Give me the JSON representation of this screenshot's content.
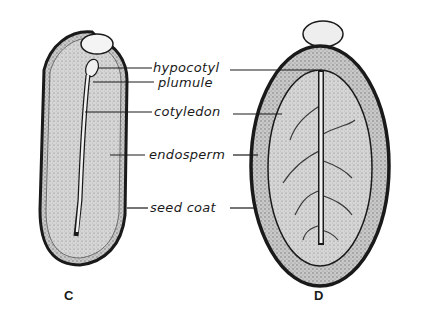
{
  "figure": {
    "labels": {
      "hypocotyl": "hypocotyl",
      "plumule": "plumule",
      "cotyledon": "cotyledon",
      "endosperm": "endosperm",
      "seed_coat": "seed coat"
    },
    "captions": {
      "left": "C",
      "right": "D"
    },
    "colors": {
      "outline": "#1a1a1a",
      "stipple": "#b8b8b8",
      "background": "#ffffff"
    }
  }
}
